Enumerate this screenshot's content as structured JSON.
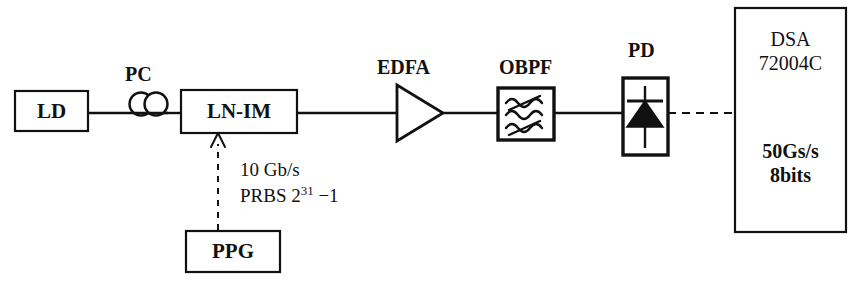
{
  "diagram": {
    "background_color": "#ffffff",
    "line_color": "#111111",
    "components": {
      "ld": {
        "label": "LD",
        "name": "laser-diode"
      },
      "pc": {
        "label": "PC",
        "name": "polarization-controller"
      },
      "lnim": {
        "label": "LN-IM",
        "name": "lithium-niobate-intensity-modulator"
      },
      "ppg": {
        "label": "PPG",
        "name": "pulse-pattern-generator"
      },
      "edfa": {
        "label": "EDFA",
        "name": "erbium-doped-fiber-amplifier"
      },
      "obpf": {
        "label": "OBPF",
        "name": "optical-bandpass-filter"
      },
      "pd": {
        "label": "PD",
        "name": "photodiode"
      },
      "dsa": {
        "name": "digital-signal-analyzer",
        "line1": "DSA",
        "line2": "72004C",
        "line3": "50Gs/s",
        "line4": "8bits"
      }
    },
    "annotations": {
      "bitrate": "10 Gb/s",
      "prbs_prefix": "PRBS 2",
      "prbs_exponent": "31",
      "prbs_suffix": " −1"
    }
  }
}
